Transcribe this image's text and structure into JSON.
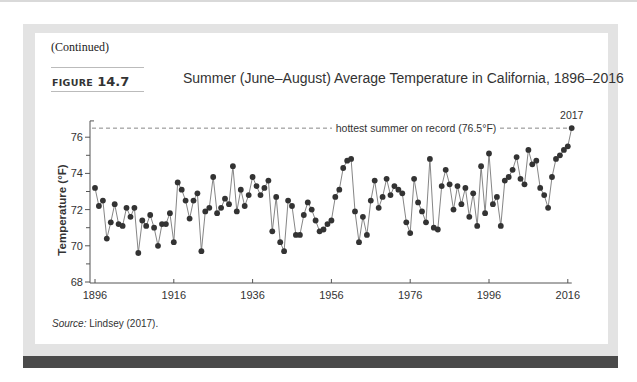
{
  "header": {
    "continued": "(Continued)",
    "figure_word": "FIGURE",
    "figure_number": "14.7",
    "title": "Summer (June–August) Average Temperature in California, 1896–2016"
  },
  "source": {
    "label": "Source:",
    "text": " Lindsey (2017)."
  },
  "colors": {
    "panel": "#e3e3e3",
    "bar": "#4a4a4a",
    "point": "#333333",
    "line": "#777777",
    "dashed": "#888888"
  },
  "chart_data": {
    "type": "line",
    "title": "Summer (June–August) Average Temperature in California, 1896–2016",
    "xlabel": "",
    "ylabel": "Temperature (°F)",
    "xlim": [
      1896,
      2017
    ],
    "ylim": [
      68,
      77
    ],
    "xticks": [
      1896,
      1916,
      1936,
      1956,
      1976,
      1996,
      2016
    ],
    "yticks": [
      68,
      70,
      72,
      74,
      76
    ],
    "grid": false,
    "legend": null,
    "annotations": [
      {
        "text": "hottest summer on record (76.5°F)",
        "type": "dashed-hline",
        "y": 76.5
      },
      {
        "text": "2017",
        "x": 2017,
        "y": 76.5
      }
    ],
    "series": [
      {
        "name": "Summer average temperature",
        "x_start": 1896,
        "x_end": 2017,
        "values": [
          73.2,
          72.2,
          72.5,
          70.4,
          71.3,
          72.3,
          71.2,
          71.1,
          72.1,
          71.6,
          72.1,
          69.6,
          71.4,
          71.1,
          71.7,
          71.0,
          70.0,
          71.2,
          71.2,
          71.8,
          70.2,
          73.5,
          73.1,
          72.5,
          71.5,
          72.5,
          72.9,
          69.7,
          71.9,
          72.1,
          73.8,
          71.8,
          72.1,
          72.6,
          72.3,
          74.4,
          71.9,
          73.1,
          72.2,
          72.8,
          73.8,
          73.3,
          72.8,
          73.2,
          73.6,
          70.8,
          72.7,
          70.2,
          69.7,
          72.5,
          72.2,
          70.6,
          70.6,
          71.7,
          72.4,
          72.0,
          71.4,
          70.8,
          70.9,
          71.2,
          71.4,
          72.7,
          73.1,
          74.3,
          74.7,
          74.8,
          71.9,
          70.2,
          71.6,
          70.6,
          72.5,
          73.6,
          72.1,
          72.7,
          73.7,
          72.8,
          73.3,
          73.1,
          72.9,
          71.3,
          70.7,
          73.7,
          72.4,
          71.9,
          71.3,
          74.8,
          71.0,
          70.9,
          73.3,
          74.2,
          73.4,
          72.0,
          73.3,
          72.3,
          73.2,
          71.6,
          72.9,
          71.1,
          74.4,
          71.8,
          75.1,
          72.3,
          72.7,
          71.1,
          73.6,
          73.8,
          74.2,
          74.9,
          73.7,
          73.4,
          75.3,
          74.5,
          74.7,
          73.2,
          72.8,
          72.1,
          73.8,
          74.8,
          75.0,
          75.3,
          75.5,
          76.5
        ]
      }
    ]
  }
}
